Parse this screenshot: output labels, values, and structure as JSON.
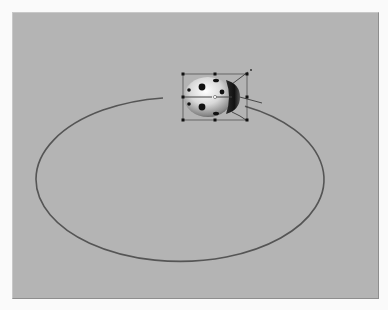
{
  "canvas": {
    "background_color": "#b4b4b4",
    "page_color": "#fafafa"
  },
  "motion_path": {
    "shape": "ellipse",
    "stroke_color": "#555555",
    "stroke_width": 1.6,
    "cx": 190,
    "cy": 177,
    "rx": 144,
    "ry": 82,
    "gap_start_x": 163,
    "gap_end_x": 245
  },
  "selected_object": {
    "name": "ladybug",
    "icon": "ladybug-icon",
    "bounding_box": {
      "x": 183,
      "y": 74,
      "width": 64,
      "height": 46
    },
    "handle_color": "#111111",
    "rotation_handle": {
      "x": 251,
      "y": 70
    }
  }
}
